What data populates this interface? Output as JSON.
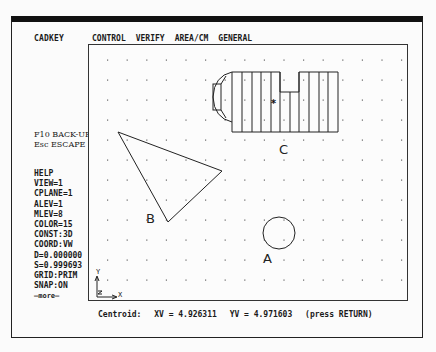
{
  "app": {
    "title": "CADKEY"
  },
  "menu": {
    "items": [
      {
        "label": "CONTROL"
      },
      {
        "label": "VERIFY"
      },
      {
        "label": "AREA/CM"
      },
      {
        "label": "GENERAL"
      }
    ]
  },
  "function_keys": {
    "back": "F10 BACK-UP",
    "escape": "Esc ESCAPE"
  },
  "status_panel": {
    "items": [
      "HELP",
      "VIEW=1",
      "CPLANE=1",
      "ALEV=1",
      "MLEV=8",
      "COLOR=15",
      "CONST:3D",
      "COORD:VW",
      "D=0.000000",
      "S=0.999693",
      "GRID:PRIM",
      "SNAP:ON",
      "—more—"
    ]
  },
  "drawing": {
    "labels": {
      "a": "A",
      "b": "B",
      "c": "C"
    },
    "axes": {
      "x": "X",
      "y": "Y",
      "z": "Z"
    },
    "line_color": "#222222"
  },
  "prompt": {
    "label": "Centroid:",
    "xv": "XV = 4.926311",
    "yv": "YV = 4.971603",
    "hint": "(press RETURN)"
  }
}
